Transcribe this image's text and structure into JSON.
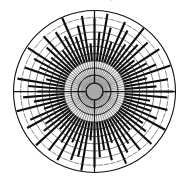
{
  "figure": {
    "background_color": "#ffffff",
    "width": 190,
    "height": 177,
    "cropped_caption_text": "circular barplot"
  },
  "chart_data": {
    "type": "bar",
    "subtype": "polar-circular-barplot",
    "title": "",
    "subtitle": "",
    "xlabel": "",
    "ylabel": "",
    "grid": true,
    "legend_position": "none",
    "axis_tick_labels": [],
    "legend_entries": [],
    "annotations": [],
    "polar": {
      "center_x": 94.5,
      "center_y": 91.5,
      "outer_radius": 81,
      "hub_radius": 8.5,
      "hub_fill_color": "#a9a9a9",
      "hub_stroke_color": "#1a1a1a",
      "outer_circle_color": "#111111",
      "bar_color": "#0d0d0d",
      "inner_ray_color": "#9a9a9a",
      "tick_color": "#222222",
      "axis_line_color": "#111111",
      "bar_count": 76,
      "bar_thickness": 2.1,
      "inner_ray_thickness": 1.15,
      "bar_start_radius_fraction": 0.38,
      "tick_ring_count": 9,
      "tick_ring_inner_fraction": 0.2,
      "tick_half_length": 2.6,
      "axis_angles_deg": [
        0,
        90,
        180,
        270
      ]
    },
    "theta_start_deg": 0,
    "theta_direction": "counterclockwise",
    "rlim": [
      0,
      1
    ],
    "categories": [
      "s01",
      "s02",
      "s03",
      "s04",
      "s05",
      "s06",
      "s07",
      "s08",
      "s09",
      "s10",
      "s11",
      "s12",
      "s13",
      "s14",
      "s15",
      "s16",
      "s17",
      "s18",
      "s19",
      "s20",
      "s21",
      "s22",
      "s23",
      "s24",
      "s25",
      "s26",
      "s27",
      "s28",
      "s29",
      "s30",
      "s31",
      "s32",
      "s33",
      "s34",
      "s35",
      "s36",
      "s37",
      "s38",
      "s39",
      "s40",
      "s41",
      "s42",
      "s43",
      "s44",
      "s45",
      "s46",
      "s47",
      "s48",
      "s49",
      "s50",
      "s51",
      "s52",
      "s53",
      "s54",
      "s55",
      "s56",
      "s57",
      "s58",
      "s59",
      "s60",
      "s61",
      "s62",
      "s63",
      "s64",
      "s65",
      "s66",
      "s67",
      "s68",
      "s69",
      "s70",
      "s71",
      "s72",
      "s73",
      "s74",
      "s75",
      "s76"
    ],
    "values": [
      0.97,
      0.74,
      0.91,
      0.63,
      0.99,
      0.81,
      0.7,
      0.95,
      0.58,
      0.88,
      0.76,
      0.99,
      0.66,
      0.84,
      0.93,
      0.61,
      0.79,
      0.97,
      0.71,
      0.89,
      0.55,
      0.94,
      0.82,
      0.68,
      0.99,
      0.75,
      0.86,
      0.6,
      0.92,
      0.78,
      0.64,
      0.98,
      0.83,
      0.71,
      0.9,
      0.57,
      0.96,
      0.8,
      0.67,
      0.87,
      0.73,
      0.99,
      0.62,
      0.85,
      0.94,
      0.69,
      0.77,
      0.98,
      0.59,
      0.91,
      0.72,
      0.96,
      0.65,
      0.88,
      0.81,
      0.99,
      0.56,
      0.93,
      0.79,
      0.7,
      0.86,
      0.63,
      0.97,
      0.84,
      0.74,
      0.9,
      0.6,
      0.95,
      0.78,
      0.68,
      0.99,
      0.82,
      0.71,
      0.92,
      0.66,
      0.89
    ]
  }
}
